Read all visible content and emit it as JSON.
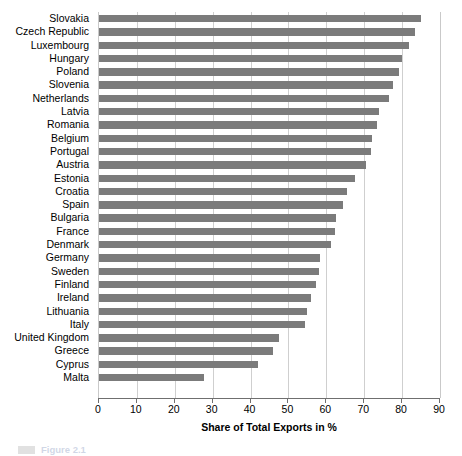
{
  "chart_data": {
    "type": "bar",
    "orientation": "horizontal",
    "title": "",
    "xlabel": "Share of Total Exports in %",
    "ylabel": "",
    "xlim": [
      0,
      90
    ],
    "xticks": [
      0,
      10,
      20,
      30,
      40,
      50,
      60,
      70,
      80,
      90
    ],
    "grid": true,
    "legend_position": "bottom-left",
    "bar_color": "#7b7b7b",
    "categories": [
      "Slovakia",
      "Czech Republic",
      "Luxembourg",
      "Hungary",
      "Poland",
      "Slovenia",
      "Netherlands",
      "Latvia",
      "Romania",
      "Belgium",
      "Portugal",
      "Austria",
      "Estonia",
      "Croatia",
      "Spain",
      "Bulgaria",
      "France",
      "Denmark",
      "Germany",
      "Sweden",
      "Finland",
      "Ireland",
      "Lithuania",
      "Italy",
      "United Kingdom",
      "Greece",
      "Cyprus",
      "Malta"
    ],
    "values": [
      85.0,
      83.3,
      81.7,
      80.0,
      79.1,
      77.5,
      76.5,
      73.8,
      73.3,
      72.0,
      71.7,
      70.6,
      67.5,
      65.5,
      64.3,
      62.5,
      62.2,
      61.2,
      58.2,
      58.0,
      57.4,
      55.9,
      55.0,
      54.5,
      47.4,
      46.0,
      42.0,
      27.8
    ]
  },
  "legend": {
    "swatch_color": "#7b7b7b",
    "label": "Figure 2.1"
  },
  "icons": {
    "legend_swatch": "legend-swatch-icon"
  }
}
